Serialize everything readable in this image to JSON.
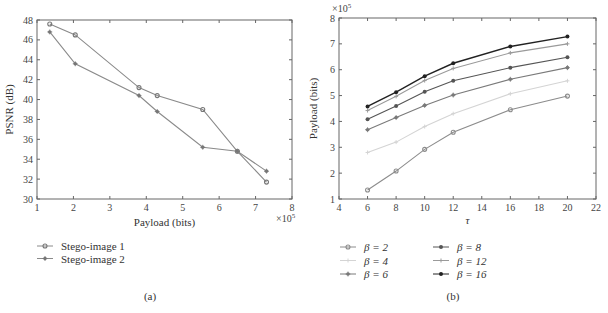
{
  "chart_data": [
    {
      "panel": "(a)",
      "type": "line",
      "xlabel": "Payload (bits)",
      "x_multiplier": "×10^5",
      "ylabel": "PSNR (dB)",
      "xlim": [
        1,
        8
      ],
      "ylim": [
        30,
        48
      ],
      "xticks": [
        1,
        2,
        3,
        4,
        5,
        6,
        7,
        8
      ],
      "yticks": [
        30,
        32,
        34,
        36,
        38,
        40,
        42,
        44,
        46,
        48
      ],
      "grid": false,
      "legend_position": "below",
      "series": [
        {
          "name": "Stego-image 1",
          "marker": "circle",
          "color": "#8a8a8a",
          "x": [
            1.35,
            2.05,
            3.8,
            4.3,
            5.55,
            6.5,
            7.3
          ],
          "y": [
            47.6,
            46.5,
            41.2,
            40.4,
            39.0,
            34.8,
            31.7
          ]
        },
        {
          "name": "Stego-image 2",
          "marker": "star",
          "color": "#8a8a8a",
          "x": [
            1.35,
            2.05,
            3.8,
            4.3,
            5.55,
            6.5,
            7.3
          ],
          "y": [
            46.8,
            43.6,
            40.4,
            38.8,
            35.2,
            34.8,
            32.8
          ]
        }
      ]
    },
    {
      "panel": "(b)",
      "type": "line",
      "xlabel": "τ",
      "ylabel": "Payload (bits)",
      "y_multiplier": "×10^5",
      "xlim": [
        4,
        22
      ],
      "ylim": [
        1,
        8
      ],
      "xticks": [
        4,
        6,
        8,
        10,
        12,
        14,
        16,
        18,
        20,
        22
      ],
      "yticks": [
        1,
        2,
        3,
        4,
        5,
        6,
        7,
        8
      ],
      "grid": false,
      "legend_position": "below",
      "x": [
        6,
        8,
        10,
        12,
        16,
        20
      ],
      "series": [
        {
          "name": "β = 2",
          "marker": "circle",
          "color": "#8c8c8c",
          "values": [
            1.35,
            2.08,
            2.92,
            3.58,
            4.45,
            4.98
          ]
        },
        {
          "name": "β = 4",
          "marker": "plus",
          "color": "#d4d4d4",
          "values": [
            2.8,
            3.2,
            3.8,
            4.3,
            5.07,
            5.57
          ]
        },
        {
          "name": "β = 6",
          "marker": "star",
          "color": "#7a7a7a",
          "values": [
            3.68,
            4.15,
            4.62,
            5.02,
            5.63,
            6.08
          ]
        },
        {
          "name": "β = 8",
          "marker": "dot",
          "color": "#555555",
          "values": [
            4.08,
            4.6,
            5.15,
            5.57,
            6.08,
            6.48
          ]
        },
        {
          "name": "β = 12",
          "marker": "plus",
          "color": "#9a9a9a",
          "values": [
            4.42,
            4.97,
            5.58,
            6.05,
            6.65,
            7.0
          ]
        },
        {
          "name": "β = 16",
          "marker": "dot",
          "color": "#222222",
          "values": [
            4.58,
            5.13,
            5.75,
            6.25,
            6.9,
            7.28
          ]
        }
      ]
    }
  ],
  "captions": {
    "a": "(a)",
    "b": "(b)"
  },
  "labels": {
    "a_xlabel": "Payload (bits)",
    "a_ylabel": "PSNR (dB)",
    "a_mult": "×10",
    "a_mult_exp": "5",
    "b_xlabel": "τ",
    "b_ylabel": "Payload (bits)",
    "b_mult": "×10",
    "b_mult_exp": "5"
  }
}
